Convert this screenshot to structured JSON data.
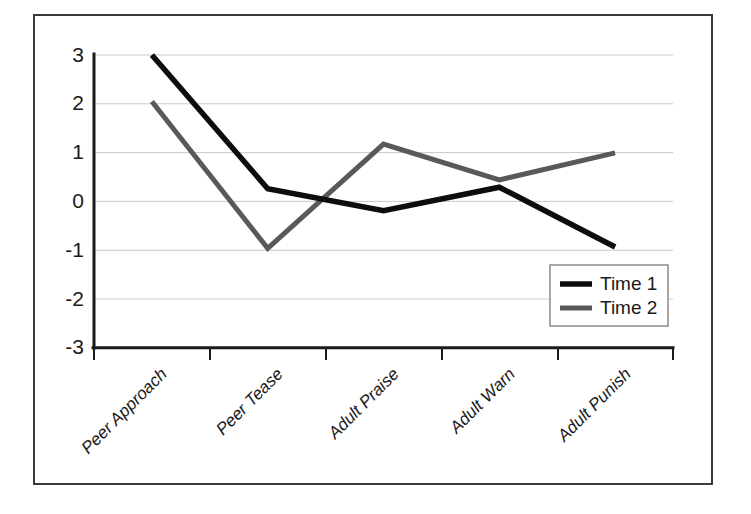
{
  "chart_data": {
    "type": "line",
    "title": "",
    "subtitle": "",
    "xlabel": "",
    "ylabel": "",
    "categories": [
      "Peer Approach",
      "Peer Tease",
      "Adult Praise",
      "Adult Warn",
      "Adult Punish"
    ],
    "series": [
      {
        "name": "Time 1",
        "color": "#0d0d0d",
        "values": [
          3.0,
          0.27,
          -0.18,
          0.3,
          -0.92
        ]
      },
      {
        "name": "Time 2",
        "color": "#595959",
        "values": [
          2.05,
          -0.95,
          1.18,
          0.45,
          1.0
        ]
      }
    ],
    "ylim": [
      -3,
      3
    ],
    "yticks": [
      3,
      2,
      1,
      0,
      -1,
      -2,
      -3
    ],
    "ytick_labels": [
      "3",
      "2",
      "1",
      "0",
      "-1",
      "-2",
      "-3"
    ],
    "grid": true,
    "grid_axis": "y",
    "legend_position": "lower right",
    "legend_entries": [
      "Time 1",
      "Time 2"
    ],
    "annotations": []
  },
  "axes": {
    "y_tick_0": "3",
    "y_tick_1": "2",
    "y_tick_2": "1",
    "y_tick_3": "0",
    "y_tick_4": "-1",
    "y_tick_5": "-2",
    "y_tick_6": "-3",
    "x_tick_0": "Peer Approach",
    "x_tick_1": "Peer Tease",
    "x_tick_2": "Adult Praise",
    "x_tick_3": "Adult Warn",
    "x_tick_4": "Adult Punish"
  },
  "legend": {
    "entry_0": "Time 1",
    "entry_1": "Time 2"
  },
  "colors": {
    "series_1": "#0d0d0d",
    "series_2": "#595959",
    "gridline": "#c9c9c9",
    "frame": "#3a3a3a",
    "background": "#ffffff"
  }
}
